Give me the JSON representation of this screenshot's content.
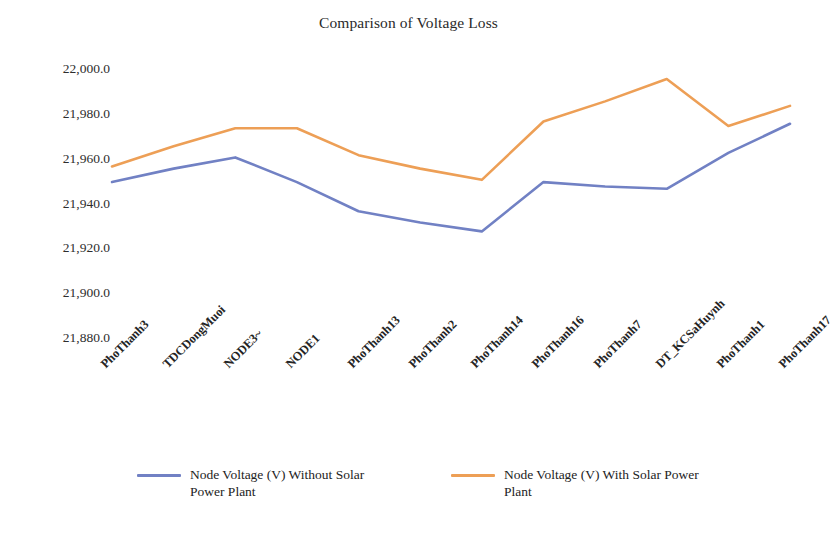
{
  "chart_data": {
    "type": "line",
    "title": "Comparison of Voltage Loss",
    "xlabel": "",
    "ylabel": "",
    "ylim": [
      21880.0,
      22000.0
    ],
    "yticks": [
      "22,000.0",
      "21,980.0",
      "21,960.0",
      "21,940.0",
      "21,920.0",
      "21,900.0",
      "21,880.0"
    ],
    "ytick_values": [
      22000.0,
      21980.0,
      21960.0,
      21940.0,
      21920.0,
      21900.0,
      21880.0
    ],
    "grid": false,
    "legend_position": "bottom",
    "categories": [
      "PhoThanh3",
      "TDCDongMuoi",
      "NODE3~",
      "NODE1",
      "PhoThanh13",
      "PhoThanh2",
      "PhoThanh14",
      "PhoThanh16",
      "PhoThanh7",
      "DT_KCSaHuynh",
      "PhoThanh1",
      "PhoThanh17"
    ],
    "series": [
      {
        "name": "Node Voltage (V) Without Solar Power Plant",
        "color": "#7181c4",
        "values": [
          21950.0,
          21956.0,
          21961.0,
          21950.0,
          21937.0,
          21932.0,
          21928.0,
          21950.0,
          21948.0,
          21947.0,
          21963.0,
          21976.0
        ]
      },
      {
        "name": "Node Voltage (V) With Solar Power Plant",
        "color": "#ed9f56",
        "values": [
          21957.0,
          21966.0,
          21974.0,
          21974.0,
          21962.0,
          21956.0,
          21951.0,
          21977.0,
          21986.0,
          21996.0,
          21975.0,
          21984.0
        ]
      }
    ]
  },
  "legend": {
    "entries": [
      {
        "label": "Node Voltage (V) Without Solar Power Plant",
        "color": "#7181c4"
      },
      {
        "label": "Node Voltage (V) With Solar Power Plant",
        "color": "#ed9f56"
      }
    ]
  },
  "colors": {
    "series_without_solar": "#7181c4",
    "series_with_solar": "#ed9f56",
    "background": "#ffffff",
    "text": "#1c1c1c"
  }
}
